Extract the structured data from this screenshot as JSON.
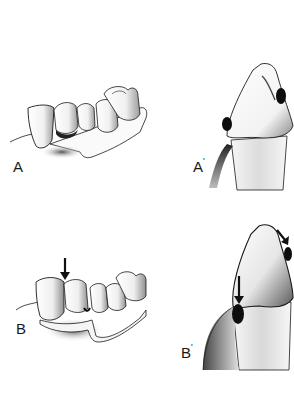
{
  "figure": {
    "type": "dental illustration",
    "colors": {
      "ink": "#1a1a1a",
      "shade": "#6b6b6b",
      "light": "#d6d6d6",
      "background": "#ffffff"
    },
    "panels": [
      {
        "id": "A",
        "label": "A",
        "prime": "",
        "subject": "fixed partial denture with retainer on canine abutment"
      },
      {
        "id": "A1",
        "label": "A",
        "prime": "'",
        "subject": "cross-section of abutment tooth with rest contacts"
      },
      {
        "id": "B",
        "label": "B",
        "prime": "",
        "subject": "denture with occlusal force arrow on abutment"
      },
      {
        "id": "B1",
        "label": "B",
        "prime": "'",
        "subject": "cross-section showing force arrows and tissue displacement"
      }
    ]
  }
}
